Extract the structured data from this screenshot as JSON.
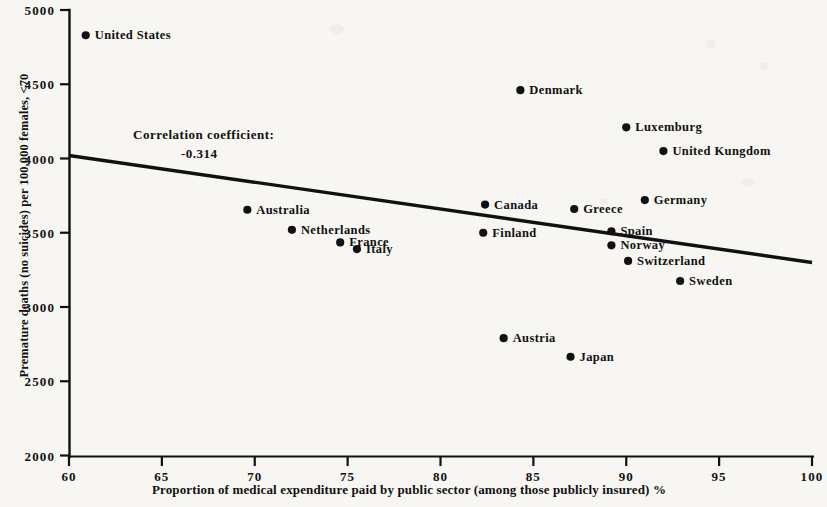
{
  "chart_data": {
    "type": "scatter",
    "title": "",
    "xlabel": "Proportion of medical expenditure paid by public sector (among those publicly insured) %",
    "ylabel": "Premature deaths (no suicides) per 100,000 females, <70",
    "xlim": [
      60,
      100
    ],
    "ylim": [
      2000,
      5000
    ],
    "xticks": [
      "60",
      "65",
      "70",
      "75",
      "80",
      "85",
      "90",
      "95",
      "100"
    ],
    "yticks": [
      "2000",
      "2500",
      "3000",
      "3500",
      "4000",
      "4500",
      "5000"
    ],
    "grid": false,
    "legend": null,
    "annotations": {
      "correlation_label": "Correlation coefficient:",
      "correlation_value": "-0.314"
    },
    "trendline": {
      "x": [
        60,
        100
      ],
      "y": [
        4020,
        3300
      ]
    },
    "points": [
      {
        "label": "United States",
        "x": 60.9,
        "y": 4830,
        "label_side": "right"
      },
      {
        "label": "Denmark",
        "x": 84.3,
        "y": 4460,
        "label_side": "right"
      },
      {
        "label": "Luxemburg",
        "x": 90.0,
        "y": 4210,
        "label_side": "right"
      },
      {
        "label": "United Kungdom",
        "x": 92.0,
        "y": 4050,
        "label_side": "right"
      },
      {
        "label": "Germany",
        "x": 91.0,
        "y": 3720,
        "label_side": "right"
      },
      {
        "label": "Canada",
        "x": 82.4,
        "y": 3690,
        "label_side": "right"
      },
      {
        "label": "Greece",
        "x": 87.2,
        "y": 3660,
        "label_side": "right"
      },
      {
        "label": "Australia",
        "x": 69.6,
        "y": 3655,
        "label_side": "right"
      },
      {
        "label": "Netherlands",
        "x": 72.0,
        "y": 3520,
        "label_side": "right"
      },
      {
        "label": "Spain",
        "x": 89.2,
        "y": 3510,
        "label_side": "right"
      },
      {
        "label": "Finland",
        "x": 82.3,
        "y": 3500,
        "label_side": "right"
      },
      {
        "label": "France",
        "x": 74.6,
        "y": 3435,
        "label_side": "right"
      },
      {
        "label": "Norway",
        "x": 89.2,
        "y": 3415,
        "label_side": "right"
      },
      {
        "label": "Italy",
        "x": 75.5,
        "y": 3390,
        "label_side": "right"
      },
      {
        "label": "Switzerland",
        "x": 90.1,
        "y": 3310,
        "label_side": "right"
      },
      {
        "label": "Sweden",
        "x": 92.9,
        "y": 3175,
        "label_side": "right"
      },
      {
        "label": "Austria",
        "x": 83.4,
        "y": 2790,
        "label_side": "right"
      },
      {
        "label": "Japan",
        "x": 87.0,
        "y": 2665,
        "label_side": "right"
      }
    ]
  },
  "style": {
    "ink": "#111111",
    "background": "#f7f6f2"
  }
}
